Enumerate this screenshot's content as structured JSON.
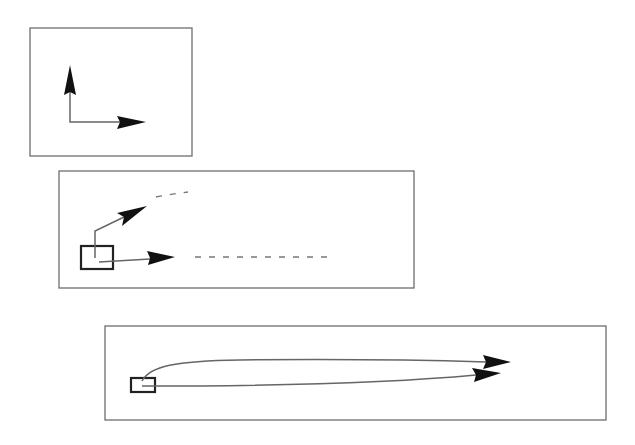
{
  "figure": {
    "colors": {
      "background": "#ffffff",
      "panel_border": "#6e6e6e",
      "line": "#666666",
      "arrowhead": "#111111",
      "box": "#222222",
      "dashed": "#777777"
    },
    "panels": [
      {
        "id": "panel-1",
        "rect": [
          30,
          28,
          162,
          128
        ],
        "elements": [
          "vertical-arrow-up",
          "horizontal-arrow-right"
        ]
      },
      {
        "id": "panel-2",
        "rect": [
          59,
          171,
          355,
          117
        ],
        "elements": [
          "origin-box",
          "diagonal-arrow",
          "horizontal-arrow",
          "dashed-continuation-upper",
          "dashed-continuation-lower"
        ]
      },
      {
        "id": "panel-3",
        "rect": [
          105,
          326,
          501,
          94
        ],
        "elements": [
          "origin-box",
          "curved-long-arrow-upper",
          "long-arrow-lower"
        ]
      }
    ]
  }
}
